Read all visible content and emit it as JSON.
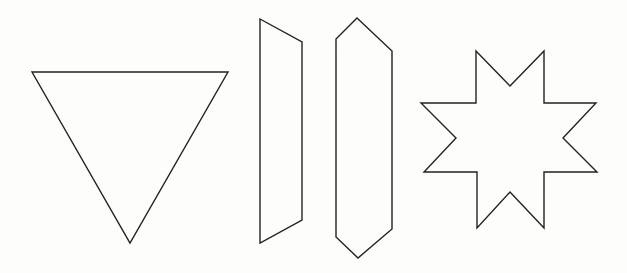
{
  "canvas": {
    "width": 627,
    "height": 273,
    "background": "#fdfdfb",
    "stroke": "#222222"
  },
  "shapes": [
    {
      "id": "triangle",
      "type": "inverted-triangle",
      "points": "32,72 228,72 130,243"
    },
    {
      "id": "parallelogram",
      "type": "slanted-quadrilateral",
      "points": "260,19 302,42 302,220 260,243"
    },
    {
      "id": "hexagon",
      "type": "elongated-hexagon",
      "points": "357,18 392,51 392,229 358,258 336,237 336,39"
    },
    {
      "id": "star",
      "type": "eight-pointed-star",
      "points": "476,51 510,86 544,51 544,103 596,103 563,138 597,172 544,172 544,228 510,192 477,228 477,172 424,172 456,138 421,103 476,103"
    }
  ]
}
